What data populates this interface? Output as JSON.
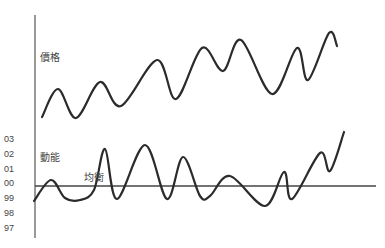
{
  "labels": {
    "price": "價格",
    "momentum": "動能",
    "equilibrium": "均衡"
  },
  "y_ticks": [
    "03",
    "02",
    "01",
    "00",
    "99",
    "98",
    "97"
  ],
  "colors": {
    "curve": "#2b2b2b",
    "axis": "#555555",
    "text": "#444444",
    "background": "#ffffff"
  },
  "chart_data": {
    "type": "line",
    "title": "",
    "series": [
      {
        "name": "價格",
        "description": "Price curve oscillating with an overall upward trend",
        "points": [
          [
            42,
            117
          ],
          [
            58,
            89
          ],
          [
            76,
            118
          ],
          [
            100,
            82
          ],
          [
            121,
            106
          ],
          [
            157,
            60
          ],
          [
            176,
            99
          ],
          [
            202,
            48
          ],
          [
            223,
            71
          ],
          [
            241,
            40
          ],
          [
            272,
            94
          ],
          [
            297,
            48
          ],
          [
            308,
            80
          ],
          [
            329,
            33
          ],
          [
            337,
            46
          ]
        ]
      },
      {
        "name": "動能",
        "description": "Momentum curve oscillating around the equilibrium line, rising at the end",
        "points": [
          [
            34,
            201
          ],
          [
            51,
            180
          ],
          [
            65,
            198
          ],
          [
            80,
            200
          ],
          [
            94,
            190
          ],
          [
            105,
            149
          ],
          [
            117,
            199
          ],
          [
            145,
            145
          ],
          [
            167,
            199
          ],
          [
            183,
            157
          ],
          [
            200,
            196
          ],
          [
            210,
            196
          ],
          [
            230,
            176
          ],
          [
            265,
            206
          ],
          [
            284,
            172
          ],
          [
            292,
            199
          ],
          [
            320,
            153
          ],
          [
            330,
            171
          ],
          [
            344,
            132
          ]
        ]
      }
    ],
    "reference_line": {
      "name": "均衡",
      "y_tick": "00"
    },
    "y_tick_labels": [
      "03",
      "02",
      "01",
      "00",
      "99",
      "98",
      "97"
    ],
    "xlabel": "",
    "ylabel": "",
    "grid": false,
    "legend": "none (inline labels)"
  }
}
